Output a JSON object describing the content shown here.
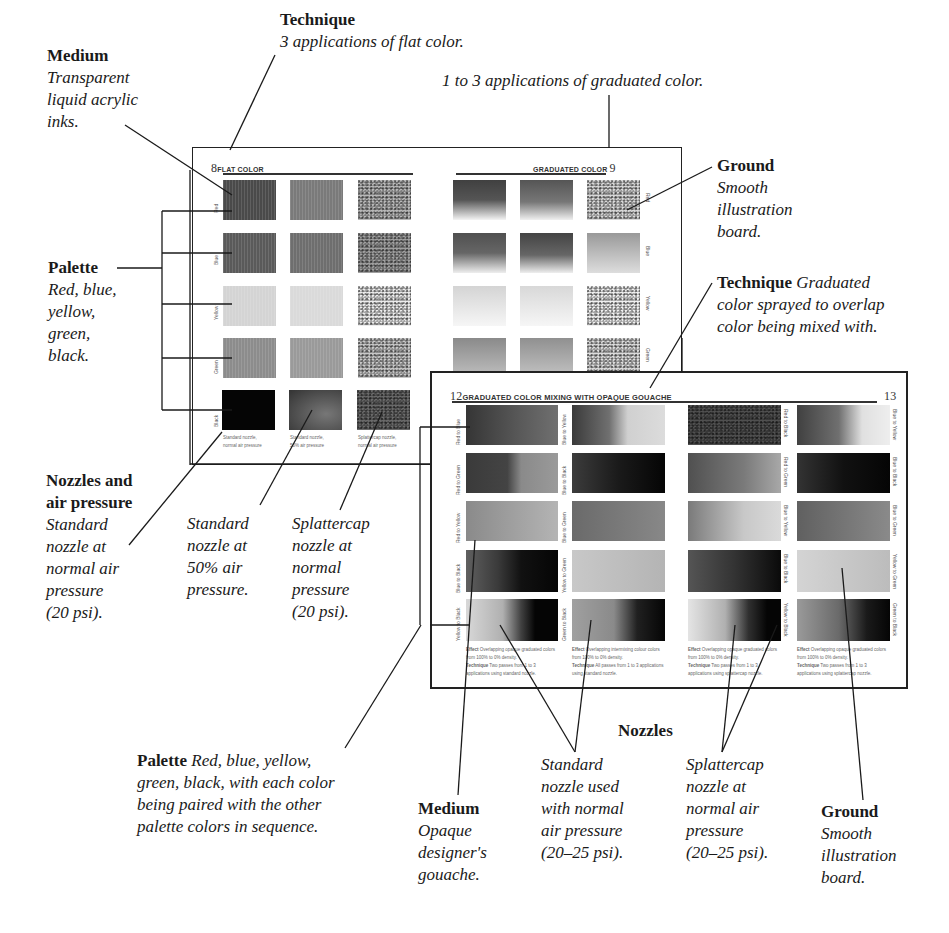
{
  "annotations": {
    "medium_top": {
      "heading": "Medium",
      "lines": [
        "Transparent",
        "liquid acrylic",
        "inks."
      ]
    },
    "technique_top": {
      "heading": "Technique",
      "lines": [
        "3 applications of flat color."
      ]
    },
    "graduated_note": {
      "lines": [
        "1 to 3 applications of graduated color."
      ]
    },
    "ground_top": {
      "heading": "Ground",
      "lines": [
        "Smooth",
        "illustration",
        "board."
      ]
    },
    "palette_left": {
      "heading": "Palette",
      "lines": [
        "Red, blue,",
        "yellow,",
        "green,",
        "black."
      ]
    },
    "technique_right": {
      "heading": "Technique",
      "inline": "Graduated",
      "lines": [
        "color sprayed to overlap",
        "color being mixed with."
      ]
    },
    "nozzles_air": {
      "heading_lines": [
        "Nozzles and",
        "air pressure"
      ],
      "lines": [
        "Standard",
        "nozzle at",
        "normal air",
        "pressure",
        "(20 psi)."
      ]
    },
    "standard_50": {
      "lines": [
        "Standard",
        "nozzle at",
        "50% air",
        "pressure."
      ]
    },
    "splattercap_20": {
      "lines": [
        "Splattercap",
        "nozzle at",
        "normal",
        "pressure",
        "(20 psi)."
      ]
    },
    "palette_bottom": {
      "heading": "Palette",
      "inline": "Red, blue, yellow,",
      "lines": [
        "green, black, with each color",
        "being paired with the other",
        "palette colors in sequence."
      ]
    },
    "nozzles_bottom": {
      "heading": "Nozzles"
    },
    "medium_bottom": {
      "heading": "Medium",
      "lines": [
        "Opaque",
        "designer's",
        "gouache."
      ]
    },
    "standard_bottom": {
      "lines": [
        "Standard",
        "nozzle used",
        "with normal",
        "air pressure",
        "(20–25 psi)."
      ]
    },
    "splattercap_bottom": {
      "lines": [
        "Splattercap",
        "nozzle at",
        "normal air",
        "pressure",
        "(20–25 psi)."
      ]
    },
    "ground_bottom": {
      "heading": "Ground",
      "lines": [
        "Smooth",
        "illustration",
        "board."
      ]
    }
  },
  "spread_top": {
    "left_page": {
      "number": "8",
      "title": "FLAT COLOR"
    },
    "right_page": {
      "number": "9",
      "title": "GRADUATED COLOR"
    },
    "row_labels": [
      "Red",
      "Blue",
      "Yellow",
      "Green",
      "Black"
    ],
    "captions": [
      [
        "Standard nozzle,",
        "normal air pressure"
      ],
      [
        "Standard nozzle,",
        "50% air pressure"
      ],
      [
        "Splattercap nozzle,",
        "normal air pressure"
      ]
    ],
    "colors": {
      "rows": [
        "#4a4a4a",
        "#5a5a5a",
        "#d4d4d4",
        "#8c8c8c",
        "#050505"
      ],
      "mid": [
        "#7a7a7a",
        "#6e6e6e",
        "#d8d8d8",
        "#9a9a9a",
        "#555555"
      ]
    }
  },
  "spread_bottom": {
    "left_page": {
      "number": "12",
      "title": "GRADUATED COLOR MIXING WITH OPAQUE GOUACHE"
    },
    "right_page": {
      "number": "13"
    },
    "left_col1_labels": [
      "Red to Blue",
      "Red to Green",
      "Red to Yellow",
      "Blue to Black",
      "Yellow to Black"
    ],
    "left_col2_labels": [
      "Blue to Yellow",
      "Blue to Black",
      "Blue to Green",
      "Yellow to Green",
      "Green to Black"
    ],
    "right_col1_labels": [
      "Red to Black",
      "Red to Green",
      "Blue to Yellow",
      "Blue to Black",
      "Yellow to Black"
    ],
    "right_col2_labels": [
      "Blue to Yellow",
      "Blue to Black",
      "Blue to Green",
      "Yellow to Green",
      "Green to Black"
    ],
    "captions": [
      {
        "effect": "Effect",
        "effect_text": "Overlapping opaque graduated colors from 100% to 0% density.",
        "technique": "Technique",
        "technique_text": "Two passes from 1 to 3 applications using standard nozzle."
      },
      {
        "effect": "Effect",
        "effect_text": "Overlapping intermixing colour colors from 100% to 0% density.",
        "technique": "Technique",
        "technique_text": "All passes from 1 to 3 applications using standard nozzle."
      },
      {
        "effect": "Effect",
        "effect_text": "Overlapping opaque graduated colors from 100% to 0% density.",
        "technique": "Technique",
        "technique_text": "Two passes from 1 to 3 applications using splattercap nozzle."
      },
      {
        "effect": "Effect",
        "effect_text": "Overlapping opaque graduated colors from 100% to 0% density.",
        "technique": "Technique",
        "technique_text": "Two passes from 1 to 3 applications using splattercap nozzle."
      }
    ]
  }
}
